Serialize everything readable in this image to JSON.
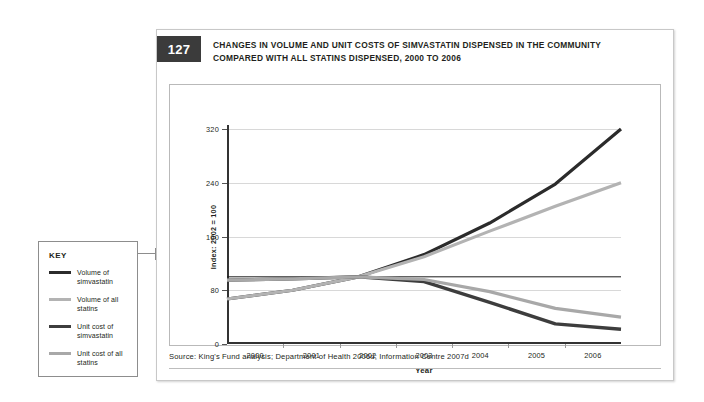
{
  "figure": {
    "number": "127",
    "title_line1": "CHANGES IN VOLUME AND UNIT COSTS OF SIMVASTATIN DISPENSED IN THE COMMUNITY",
    "title_line2": "COMPARED WITH ALL STATINS DISPENSED, 2000 TO 2006",
    "source": "Source: King's Fund analysis; Department of Health 2006d; Information Centre 2007d"
  },
  "key": {
    "title": "KEY",
    "items": [
      {
        "label_line1": "Volume of",
        "label_line2": "simvastatin",
        "color": "#2b2b2b"
      },
      {
        "label_line1": "Volume of all",
        "label_line2": "statins",
        "color": "#b3b3b3"
      },
      {
        "label_line1": "Unit cost of",
        "label_line2": "simvastatin",
        "color": "#3d3d3d"
      },
      {
        "label_line1": "Unit cost of all",
        "label_line2": "statins",
        "color": "#a8a8a8"
      }
    ]
  },
  "chart_data": {
    "type": "line",
    "title": "CHANGES IN VOLUME AND UNIT COSTS OF SIMVASTATIN DISPENSED IN THE COMMUNITY COMPARED WITH ALL STATINS DISPENSED, 2000 TO 2006",
    "xlabel": "Year",
    "ylabel": "Index: 2002 = 100",
    "x": [
      2000,
      2001,
      2002,
      2003,
      2004,
      2005,
      2006
    ],
    "categories": [
      "2000",
      "2001",
      "2002",
      "2003",
      "2004",
      "2005",
      "2006"
    ],
    "xlim": [
      2000,
      2006
    ],
    "ylim": [
      0,
      320
    ],
    "yticks": [
      0,
      80,
      160,
      240,
      320
    ],
    "xticks": [
      "2000",
      "2001",
      "2002",
      "2003",
      "2004",
      "2005",
      "2006"
    ],
    "grid": true,
    "reference_line": 100,
    "legend_position": "external-left",
    "series": [
      {
        "name": "Volume of simvastatin",
        "color": "#2b2b2b",
        "width": 3.2,
        "values": [
          67,
          80,
          100,
          133,
          180,
          238,
          320
        ]
      },
      {
        "name": "Volume of all statins",
        "color": "#b3b3b3",
        "width": 3.2,
        "values": [
          67,
          80,
          100,
          130,
          168,
          205,
          240
        ]
      },
      {
        "name": "Unit cost of simvastatin",
        "color": "#3d3d3d",
        "width": 3.4,
        "values": [
          95,
          97,
          100,
          93,
          62,
          30,
          22
        ]
      },
      {
        "name": "Unit cost of all statins",
        "color": "#a8a8a8",
        "width": 3.2,
        "values": [
          95,
          97,
          100,
          96,
          78,
          53,
          40
        ]
      }
    ]
  }
}
